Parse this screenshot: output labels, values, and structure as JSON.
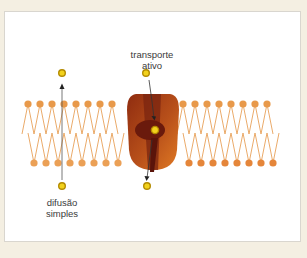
{
  "diagram": {
    "type": "cell membrane transport",
    "labels": {
      "active_transport_line1": "transporte",
      "active_transport_line2": "ativo",
      "diffusion_line1": "difusão",
      "diffusion_line2": "simples"
    },
    "colors": {
      "background": "#f4efe2",
      "panel": "#ffffff",
      "phospholipid_head_top": "#e8994a",
      "phospholipid_head_bottom": "#e89a4c",
      "phospholipid_tail": "#e8a25a",
      "protein_outer": "#9b3512",
      "protein_inner": "#d4691e",
      "protein_channel": "#6a1a0c",
      "molecule_fill": "#f2d21c",
      "molecule_ring": "#b38a00",
      "arrow": "#333333"
    },
    "membrane": {
      "left_group_heads": 8,
      "right_group_heads": 8
    }
  }
}
